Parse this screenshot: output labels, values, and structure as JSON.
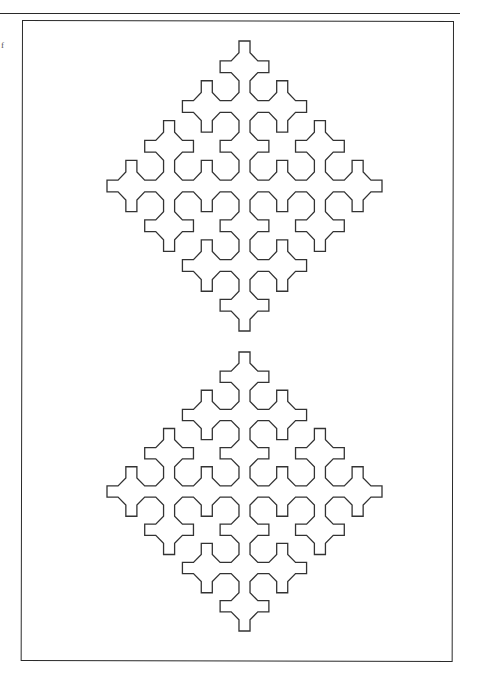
{
  "page": {
    "margin_glyph": "f",
    "background": "#ffffff",
    "ink_color": "#333333"
  },
  "figure": {
    "type": "sierpinski-curve",
    "frame": {
      "x": 22,
      "y": 20,
      "width": 432,
      "height": 641
    },
    "lsystem": {
      "axiom": "F--XF--F--XF",
      "rules": {
        "X": "XF+G+XF--F--XF+G+X"
      },
      "angle_deg": 45,
      "order": 3,
      "diagonal_draw_symbol": "F",
      "orthogonal_draw_symbol": "G"
    },
    "curves": [
      {
        "name": "upper-curve",
        "bbox": {
          "x": 107,
          "y": 41,
          "width": 275,
          "height": 290
        }
      },
      {
        "name": "lower-curve",
        "bbox": {
          "x": 107,
          "y": 352,
          "width": 275,
          "height": 279
        }
      }
    ]
  }
}
